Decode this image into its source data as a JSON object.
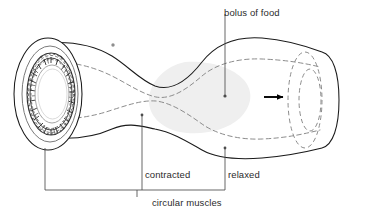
{
  "figure": {
    "background_color": "#ffffff",
    "width": 370,
    "height": 216
  },
  "labels": {
    "bolus": "bolus of food",
    "contracted": "contracted",
    "relaxed": "relaxed",
    "circular_muscles": "circular muscles"
  },
  "colors": {
    "outline": "#1a1a1a",
    "lumen_dashed": "#8c8c8c",
    "bolus_fill": "#efefef",
    "muscle_ring": "#3a3a3a",
    "leader_line": "#4d4d4d",
    "arrow": "#000000",
    "text": "#2b2b2b"
  },
  "parts": {
    "cut_end": "cut-away circular muscle ring at left end",
    "tube_outline": "wavy solid tube wall",
    "lumen": "dashed inner lumen line",
    "bolus": "shaded food mass inside relaxed segment",
    "arrow": "direction of bolus movement (rightward)",
    "far_opening": "dashed ellipses of far tube opening"
  },
  "annotation_marks": {
    "asterisk_mark": "*"
  }
}
